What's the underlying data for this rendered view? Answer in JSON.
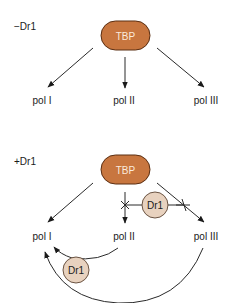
{
  "panels": [
    {
      "condition_label": "−Dr1",
      "center_node": "TBP",
      "targets": [
        "pol I",
        "pol II",
        "pol III"
      ]
    },
    {
      "condition_label": "+Dr1",
      "center_node": "TBP",
      "targets": [
        "pol I",
        "pol II",
        "pol III"
      ],
      "inhibitor_upper": "Dr1",
      "inhibitor_lower": "Dr1"
    }
  ],
  "colors": {
    "tbp_fill": "#c8763f",
    "tbp_stroke": "#5a2e12",
    "dr1_fill": "#e8d2bf",
    "dr1_stroke": "#6b5443",
    "line": "#2a2a2a"
  }
}
